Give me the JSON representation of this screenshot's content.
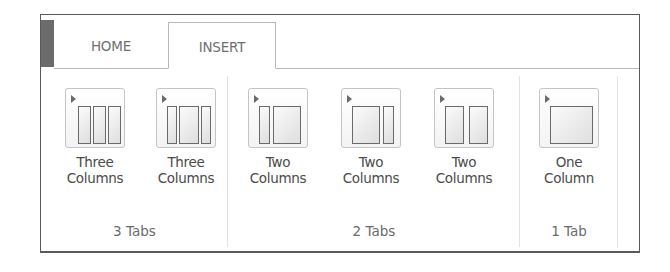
{
  "tabs": [
    {
      "label": "HOME",
      "active": false
    },
    {
      "label": "INSERT",
      "active": true
    }
  ],
  "groups": [
    {
      "label": "3 Tabs",
      "buttons": [
        {
          "line1": "Three",
          "line2": "Columns",
          "icon": "three-columns-equal-icon"
        },
        {
          "line1": "Three",
          "line2": "Columns",
          "icon": "three-columns-wide-center-icon"
        }
      ]
    },
    {
      "label": "2 Tabs",
      "buttons": [
        {
          "line1": "Two",
          "line2": "Columns",
          "icon": "two-columns-narrow-left-icon"
        },
        {
          "line1": "Two",
          "line2": "Columns",
          "icon": "two-columns-narrow-right-icon"
        },
        {
          "line1": "Two",
          "line2": "Columns",
          "icon": "two-columns-equal-icon"
        }
      ]
    },
    {
      "label": "1 Tab",
      "buttons": [
        {
          "line1": "One",
          "line2": "Column",
          "icon": "one-column-icon"
        }
      ]
    }
  ],
  "colors": {
    "accent_block": "#6b6b6b",
    "frame_border": "#5a5a5a",
    "icon_stroke": "#6a6a6a",
    "text": "#4a4a4a"
  }
}
